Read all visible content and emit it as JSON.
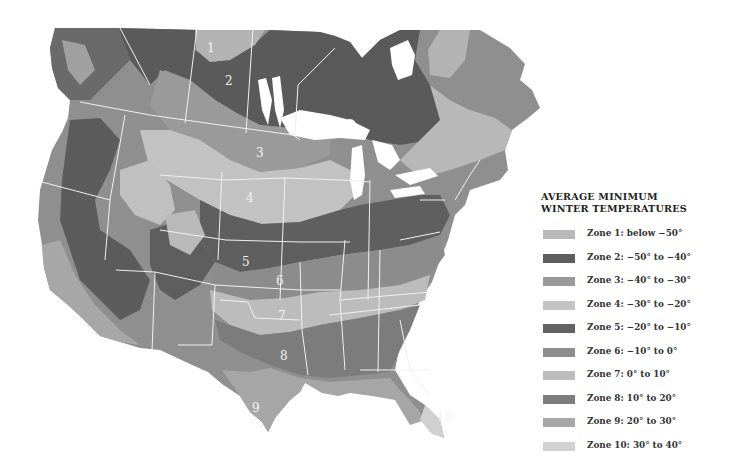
{
  "legend": {
    "title_line1": "AVERAGE MINIMUM",
    "title_line2": "WINTER TEMPERATURES",
    "items": [
      {
        "zone": 1,
        "label": "Zone 1: below −50°",
        "color": "#b9b9b9"
      },
      {
        "zone": 2,
        "label": "Zone 2: −50° to −40°",
        "color": "#5e5e5e"
      },
      {
        "zone": 3,
        "label": "Zone 3: −40° to −30°",
        "color": "#9a9a9a"
      },
      {
        "zone": 4,
        "label": "Zone 4: −30° to −20°",
        "color": "#c4c4c4"
      },
      {
        "zone": 5,
        "label": "Zone 5: −20° to −10°",
        "color": "#636363"
      },
      {
        "zone": 6,
        "label": "Zone 6: −10° to 0°",
        "color": "#8e8e8e"
      },
      {
        "zone": 7,
        "label": "Zone 7: 0° to 10°",
        "color": "#bdbdbd"
      },
      {
        "zone": 8,
        "label": "Zone 8: 10° to 20°",
        "color": "#7d7d7d"
      },
      {
        "zone": 9,
        "label": "Zone 9: 20° to 30°",
        "color": "#a8a8a8"
      },
      {
        "zone": 10,
        "label": "Zone 10: 30° to 40°",
        "color": "#d2d2d2"
      }
    ]
  },
  "map": {
    "zone_labels": [
      {
        "text": "1",
        "x": 211,
        "y": 52
      },
      {
        "text": "2",
        "x": 229,
        "y": 85
      },
      {
        "text": "3",
        "x": 260,
        "y": 157
      },
      {
        "text": "4",
        "x": 250,
        "y": 202
      },
      {
        "text": "5",
        "x": 246,
        "y": 266
      },
      {
        "text": "6",
        "x": 280,
        "y": 285
      },
      {
        "text": "7",
        "x": 282,
        "y": 320
      },
      {
        "text": "8",
        "x": 284,
        "y": 360
      },
      {
        "text": "9",
        "x": 256,
        "y": 412
      },
      {
        "text": "10",
        "x": 445,
        "y": 421
      }
    ]
  }
}
